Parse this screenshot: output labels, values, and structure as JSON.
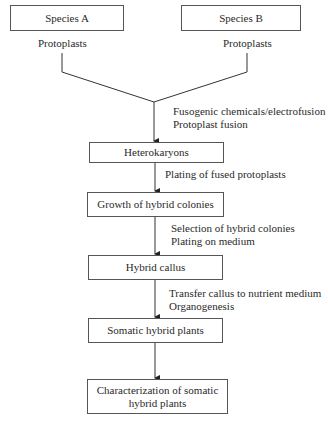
{
  "diagram": {
    "type": "flowchart",
    "sources": [
      {
        "box": "Species A",
        "label": "Protoplasts"
      },
      {
        "box": "Species B",
        "label": "Protoplasts"
      }
    ],
    "steps": [
      {
        "box": "Heterokaryons",
        "edge_label": [
          "Fusogenic chemicals/electrofusion",
          "Protoplast fusion"
        ]
      },
      {
        "box": "Growth of hybrid colonies",
        "edge_label": [
          "Plating of fused protoplasts"
        ]
      },
      {
        "box": "Hybrid callus",
        "edge_label": [
          "Selection of hybrid colonies",
          "Plating on medium"
        ]
      },
      {
        "box": "Somatic hybrid plants",
        "edge_label": [
          "Transfer callus to nutrient medium",
          "Organogenesis"
        ]
      },
      {
        "box": "Characterization of somatic hybrid plants",
        "box_lines": [
          "Characterization of somatic",
          "hybrid plants"
        ],
        "edge_label": []
      }
    ]
  }
}
